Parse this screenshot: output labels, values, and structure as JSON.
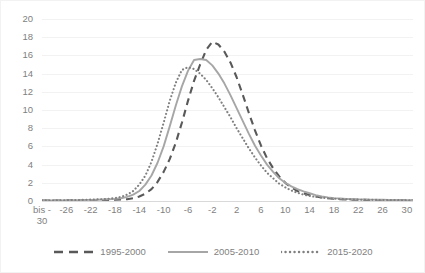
{
  "chart": {
    "title_partial": "",
    "background": "#ffffff",
    "border_color": "#f2f2f2",
    "gridline_color": "#f2f2f2",
    "axis_zero_color": "#d9d9d9",
    "tick_text_color": "#7f7f7f"
  },
  "legend": {
    "position": "bottom",
    "items": [
      {
        "label": "1995-2000",
        "style": "dashed",
        "color": "#595959",
        "name": "legend-item-1995-2000"
      },
      {
        "label": "2005-2010",
        "style": "solid",
        "color": "#a6a6a6",
        "name": "legend-item-2005-2010"
      },
      {
        "label": "2015-2020",
        "style": "dotted",
        "color": "#808080",
        "name": "legend-item-2015-2020"
      }
    ]
  },
  "yaxis": {
    "min": 0,
    "max": 20,
    "step": 2,
    "ticks": [
      "0",
      "2",
      "4",
      "6",
      "8",
      "10",
      "12",
      "14",
      "16",
      "18",
      "20"
    ]
  },
  "xaxis": {
    "first_label": "bis -\n30",
    "step": 4,
    "ticks": [
      "bis -\n30",
      "-26",
      "-22",
      "-18",
      "-14",
      "-10",
      "-6",
      "-2",
      "2",
      "6",
      "10",
      "14",
      "18",
      "22",
      "26",
      "30"
    ]
  },
  "chart_data": {
    "type": "line",
    "title": "",
    "xlabel": "",
    "ylabel": "",
    "xlim": [
      -30,
      31
    ],
    "ylim": [
      0,
      20
    ],
    "grid": true,
    "legend_position": "bottom",
    "x": [
      -30,
      -29,
      -28,
      -27,
      -26,
      -25,
      -24,
      -23,
      -22,
      -21,
      -20,
      -19,
      -18,
      -17,
      -16,
      -15,
      -14,
      -13,
      -12,
      -11,
      -10,
      -9,
      -8,
      -7,
      -6,
      -5,
      -4,
      -3,
      -2,
      -1,
      0,
      1,
      2,
      3,
      4,
      5,
      6,
      7,
      8,
      9,
      10,
      11,
      12,
      13,
      14,
      15,
      16,
      17,
      18,
      19,
      20,
      21,
      22,
      23,
      24,
      25,
      26,
      27,
      28,
      29,
      30,
      31
    ],
    "xtick_labels": [
      "bis -30",
      "-26",
      "-22",
      "-18",
      "-14",
      "-10",
      "-6",
      "-2",
      "2",
      "6",
      "10",
      "14",
      "18",
      "22",
      "26",
      "30"
    ],
    "series": [
      {
        "name": "1995-2000",
        "style": "dashed",
        "color": "#595959",
        "peak_value": 17.5,
        "peak_x": -2,
        "values": [
          0.05,
          0.05,
          0.05,
          0.06,
          0.06,
          0.07,
          0.07,
          0.08,
          0.09,
          0.1,
          0.11,
          0.12,
          0.14,
          0.16,
          0.2,
          0.3,
          0.5,
          0.8,
          1.3,
          2.1,
          3.2,
          4.6,
          6.4,
          8.6,
          11.0,
          13.2,
          15.0,
          16.6,
          17.5,
          17.2,
          16.4,
          15.2,
          13.6,
          11.7,
          9.7,
          7.8,
          6.1,
          4.7,
          3.6,
          2.7,
          2.0,
          1.5,
          1.1,
          0.85,
          0.65,
          0.5,
          0.38,
          0.3,
          0.25,
          0.2,
          0.17,
          0.15,
          0.13,
          0.12,
          0.11,
          0.1,
          0.09,
          0.08,
          0.08,
          0.07,
          0.07,
          0.07
        ]
      },
      {
        "name": "2005-2010",
        "style": "solid",
        "color": "#a6a6a6",
        "peak_value": 15.6,
        "peak_x": -5,
        "values": [
          0.06,
          0.06,
          0.07,
          0.07,
          0.08,
          0.09,
          0.1,
          0.11,
          0.12,
          0.14,
          0.16,
          0.19,
          0.23,
          0.3,
          0.45,
          0.7,
          1.1,
          1.8,
          2.8,
          4.2,
          6.0,
          8.2,
          10.5,
          12.6,
          14.3,
          15.5,
          15.6,
          15.5,
          14.9,
          14.0,
          12.9,
          11.6,
          10.2,
          8.8,
          7.4,
          6.1,
          5.0,
          4.0,
          3.2,
          2.5,
          2.0,
          1.6,
          1.3,
          1.05,
          0.85,
          0.65,
          0.5,
          0.4,
          0.32,
          0.27,
          0.23,
          0.2,
          0.18,
          0.16,
          0.15,
          0.14,
          0.13,
          0.12,
          0.11,
          0.1,
          0.1,
          0.1
        ]
      },
      {
        "name": "2015-2020",
        "style": "dotted",
        "color": "#808080",
        "peak_value": 14.7,
        "peak_x": -7,
        "values": [
          0.07,
          0.07,
          0.08,
          0.08,
          0.09,
          0.1,
          0.11,
          0.13,
          0.15,
          0.17,
          0.2,
          0.25,
          0.32,
          0.45,
          0.7,
          1.1,
          1.8,
          2.8,
          4.3,
          6.3,
          8.6,
          11.0,
          13.0,
          14.4,
          14.7,
          14.5,
          14.0,
          13.3,
          12.4,
          11.4,
          10.3,
          9.2,
          8.0,
          6.9,
          5.8,
          4.8,
          3.9,
          3.1,
          2.5,
          1.9,
          1.5,
          1.15,
          0.9,
          0.7,
          0.55,
          0.45,
          0.37,
          0.3,
          0.25,
          0.22,
          0.19,
          0.17,
          0.15,
          0.14,
          0.13,
          0.12,
          0.11,
          0.1,
          0.1,
          0.09,
          0.09,
          0.09
        ]
      }
    ]
  }
}
